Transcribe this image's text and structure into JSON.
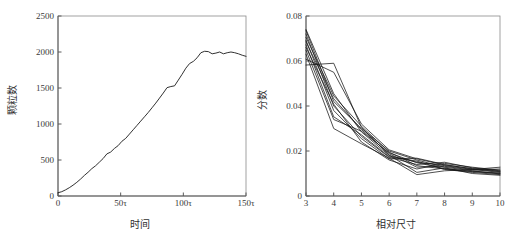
{
  "figure": {
    "background": "#ffffff",
    "ink_color": "#1a1a1a"
  },
  "chart_data": [
    {
      "type": "line",
      "panel": "left",
      "title": "",
      "xlabel": "时间",
      "ylabel": "颗粒数",
      "xlim": [
        0,
        150
      ],
      "ylim": [
        0,
        2500
      ],
      "grid": false,
      "legend": "none",
      "xticks": [
        0,
        50,
        100,
        150
      ],
      "xticklabels": [
        "0",
        "50τ",
        "100τ",
        "150τ"
      ],
      "yticks": [
        0,
        500,
        1000,
        1500,
        2000,
        2500
      ],
      "yticklabels": [
        "0",
        "500",
        "1000",
        "1500",
        "2000",
        "2500"
      ],
      "series": [
        {
          "name": "颗粒数",
          "x": [
            0,
            3,
            6,
            9,
            12,
            15,
            18,
            21,
            24,
            27,
            30,
            33,
            36,
            39,
            42,
            45,
            48,
            51,
            54,
            57,
            60,
            63,
            66,
            69,
            72,
            75,
            78,
            81,
            84,
            87,
            90,
            93,
            96,
            99,
            102,
            105,
            108,
            111,
            114,
            117,
            120,
            123,
            126,
            129,
            132,
            135,
            138,
            141,
            144,
            147,
            150
          ],
          "values": [
            45,
            60,
            85,
            115,
            150,
            190,
            235,
            285,
            330,
            380,
            420,
            470,
            520,
            585,
            610,
            660,
            700,
            760,
            800,
            860,
            920,
            980,
            1040,
            1100,
            1160,
            1225,
            1290,
            1360,
            1430,
            1505,
            1520,
            1530,
            1610,
            1690,
            1775,
            1840,
            1870,
            1920,
            1990,
            2010,
            2005,
            1975,
            1985,
            2000,
            1975,
            1990,
            2000,
            1990,
            1975,
            1955,
            1940
          ]
        }
      ]
    },
    {
      "type": "line",
      "panel": "right",
      "title": "",
      "xlabel": "相对尺寸",
      "ylabel": "分数",
      "xlim": [
        3,
        10
      ],
      "ylim": [
        0,
        0.08
      ],
      "grid": false,
      "legend": "none",
      "xticks": [
        3,
        4,
        5,
        6,
        7,
        8,
        9,
        10
      ],
      "xticklabels": [
        "3",
        "4",
        "5",
        "6",
        "7",
        "8",
        "9",
        "10"
      ],
      "yticks": [
        0,
        0.02,
        0.04,
        0.06,
        0.08
      ],
      "yticklabels": [
        "0",
        "0.02",
        "0.04",
        "0.06",
        "0.08"
      ],
      "x": [
        3,
        4,
        5,
        6,
        7,
        8,
        9,
        10
      ],
      "series": [
        {
          "name": "run-1",
          "values": [
            0.074,
            0.0455,
            0.0285,
            0.018,
            0.015,
            0.0135,
            0.0118,
            0.0105
          ]
        },
        {
          "name": "run-2",
          "values": [
            0.0735,
            0.042,
            0.03,
            0.02,
            0.016,
            0.0128,
            0.0112,
            0.0098
          ]
        },
        {
          "name": "run-3",
          "values": [
            0.072,
            0.04,
            0.0265,
            0.0172,
            0.014,
            0.015,
            0.0125,
            0.0112
          ]
        },
        {
          "name": "run-4",
          "values": [
            0.0705,
            0.0445,
            0.031,
            0.0195,
            0.0135,
            0.012,
            0.0108,
            0.01
          ]
        },
        {
          "name": "run-5",
          "values": [
            0.0692,
            0.038,
            0.0255,
            0.0165,
            0.0168,
            0.014,
            0.012,
            0.0108
          ]
        },
        {
          "name": "run-6",
          "values": [
            0.0685,
            0.0432,
            0.0295,
            0.0188,
            0.0128,
            0.0132,
            0.0115,
            0.012
          ]
        },
        {
          "name": "run-7",
          "values": [
            0.0672,
            0.0352,
            0.0272,
            0.0175,
            0.0155,
            0.0118,
            0.0105,
            0.0095
          ]
        },
        {
          "name": "run-8",
          "values": [
            0.066,
            0.0408,
            0.024,
            0.016,
            0.012,
            0.0145,
            0.0128,
            0.0115
          ]
        },
        {
          "name": "run-9",
          "values": [
            0.0648,
            0.034,
            0.0288,
            0.0192,
            0.0148,
            0.0122,
            0.011,
            0.0102
          ]
        },
        {
          "name": "run-10",
          "values": [
            0.063,
            0.03,
            0.0232,
            0.0168,
            0.0095,
            0.0112,
            0.0118,
            0.0128
          ]
        },
        {
          "name": "run-11",
          "values": [
            0.0608,
            0.055,
            0.032,
            0.0205,
            0.0165,
            0.0138,
            0.0122,
            0.011
          ]
        },
        {
          "name": "run-12",
          "values": [
            0.0582,
            0.059,
            0.0305,
            0.0182,
            0.0105,
            0.0125,
            0.01,
            0.0092
          ]
        }
      ]
    }
  ]
}
